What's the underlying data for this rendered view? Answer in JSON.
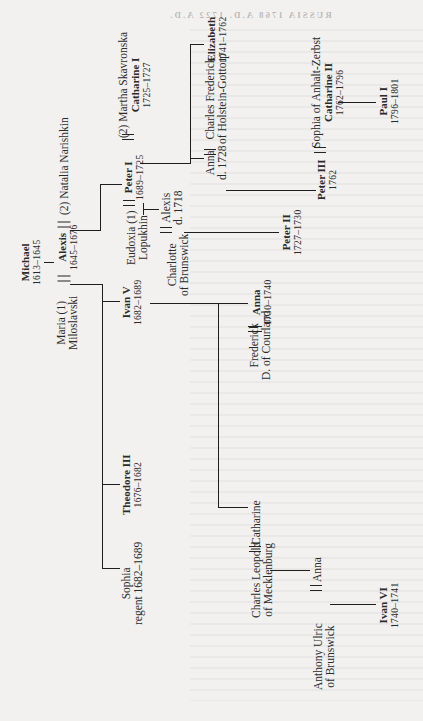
{
  "page": {
    "header_bleed": "RUSSIA 1768 A.D. 1722 A.D.",
    "orientation": "rotated-90-ccw"
  },
  "tree": {
    "michael": {
      "name": "Michael",
      "dates": "1613–1645"
    },
    "alexis": {
      "name": "Alexis",
      "dates": "1645–1676"
    },
    "maria": {
      "line1": "Maria (1)",
      "line2": "Miloslavski"
    },
    "natalia": {
      "line1": "(2) Natalia Narishkin"
    },
    "peter_i": {
      "name": "Peter I",
      "dates": "1689–1725"
    },
    "martha": {
      "line1": "(2) Martha Skavronska",
      "name": "Catharine I",
      "dates": "1725–1727"
    },
    "eudoxia": {
      "line1": "Eudoxia (1)",
      "line2": "Lopukhin"
    },
    "alexis_son": {
      "line1": "Alexis",
      "line2": "d. 1718"
    },
    "charlotte": {
      "line1": "Charlotte",
      "line2": "of Brunswick"
    },
    "peter_ii": {
      "name": "Peter II",
      "dates": "1727–1730"
    },
    "elizabeth": {
      "name": "Elizabeth",
      "dates": "1741–1762"
    },
    "anna_holstein": {
      "line1": "Anna",
      "line2": "d. 1728"
    },
    "charles_frederick": {
      "line1": "Charles Frederick",
      "line2": "of Holstein-Gottorp"
    },
    "peter_iii": {
      "name": "Peter III",
      "dates": "1762"
    },
    "sophia_anhalt": {
      "line1": "Sophia of Anhalt-Zerbst",
      "name": "Catharine II",
      "dates": "1762–1796"
    },
    "paul_i": {
      "name": "Paul I",
      "dates": "1796–1801"
    },
    "ivan_v": {
      "name": "Ivan V",
      "dates": "1682–1689"
    },
    "theodore_iii": {
      "name": "Theodore III",
      "dates": "1676–1682"
    },
    "sophia_regent": {
      "line1": "Sophia",
      "line2": "regent 1682–1689"
    },
    "anna_courland": {
      "name": "Anna",
      "dates": "1730–1740"
    },
    "frederick": {
      "line1": "Frederick",
      "line2": "D. of Courland"
    },
    "catharine": {
      "line1": "Catharine"
    },
    "charles_leopold": {
      "line1": "Charles Leopold",
      "line2": "of Mecklenburg"
    },
    "anna_mecklenburg": {
      "line1": "Anna"
    },
    "anthony_ulric": {
      "line1": "Anthony Ulric",
      "line2": "of Brunswick"
    },
    "ivan_vi": {
      "name": "Ivan VI",
      "dates": "1740–1741"
    }
  }
}
